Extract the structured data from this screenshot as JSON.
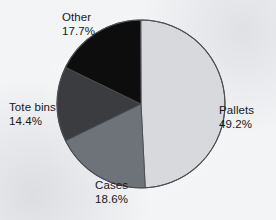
{
  "chart_data": {
    "type": "pie",
    "title": "",
    "categories": [
      "Pallets",
      "Cases",
      "Tote bins",
      "Other"
    ],
    "values": [
      49.2,
      18.6,
      14.4,
      17.7
    ],
    "unit": "%",
    "start_angle_deg": 0,
    "direction": "clockwise",
    "legend": "none",
    "grid": false,
    "labels_position": "outside",
    "slices": [
      {
        "name": "Pallets",
        "percent": 49.2,
        "percent_text": "49.2%",
        "color": "#d7d9dd",
        "start_deg": 0.0,
        "sweep_deg": 177.1
      },
      {
        "name": "Cases",
        "percent": 18.6,
        "percent_text": "18.6%",
        "color": "#6e737a",
        "start_deg": 177.1,
        "sweep_deg": 66.96
      },
      {
        "name": "Tote bins",
        "percent": 14.4,
        "percent_text": "14.4%",
        "color": "#3a3c40",
        "start_deg": 244.06,
        "sweep_deg": 51.84
      },
      {
        "name": "Other",
        "percent": 17.7,
        "percent_text": "17.7%",
        "color": "#0d0d0d",
        "start_deg": 295.9,
        "sweep_deg": 63.72
      }
    ]
  },
  "labels": {
    "other": {
      "name": "Other",
      "percent": "17.7%"
    },
    "pallets": {
      "name": "Pallets",
      "percent": "49.2%"
    },
    "tote_bins": {
      "name": "Tote bins",
      "percent": "14.4%"
    },
    "cases": {
      "name": "Cases",
      "percent": "18.6%"
    }
  },
  "style": {
    "background": "#f3f4f6",
    "outline": "#4a4d52",
    "text": "#16181b"
  }
}
